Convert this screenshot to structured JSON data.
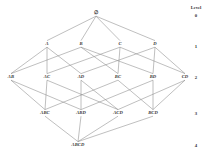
{
  "diagram": {
    "type": "hasse-lattice",
    "stroke_color": "#8a8a8a",
    "text_color": "#333333",
    "background_color": "#ffffff",
    "level_column": {
      "header": "Level",
      "header_x": 196,
      "header_y": 8,
      "numbers": [
        {
          "label": "0",
          "x": 196,
          "y": 16
        },
        {
          "label": "1",
          "x": 196,
          "y": 47
        },
        {
          "label": "2",
          "x": 196,
          "y": 78
        },
        {
          "label": "3",
          "x": 196,
          "y": 114
        },
        {
          "label": "4",
          "x": 196,
          "y": 146
        }
      ]
    },
    "nodes": [
      {
        "id": "empty",
        "label": "∅",
        "x": 96,
        "y": 13,
        "level": 0,
        "top": true
      },
      {
        "id": "A",
        "label": "A",
        "x": 47,
        "y": 44,
        "level": 1,
        "top": false
      },
      {
        "id": "B",
        "label": "B",
        "x": 81,
        "y": 44,
        "level": 1,
        "top": false
      },
      {
        "id": "C",
        "label": "C",
        "x": 120,
        "y": 44,
        "level": 1,
        "top": false
      },
      {
        "id": "D",
        "label": "D",
        "x": 155,
        "y": 44,
        "level": 1,
        "top": false
      },
      {
        "id": "AB",
        "label": "AB",
        "x": 11,
        "y": 77,
        "level": 2,
        "top": false
      },
      {
        "id": "AC",
        "label": "AC",
        "x": 47,
        "y": 77,
        "level": 2,
        "top": false
      },
      {
        "id": "AD",
        "label": "AD",
        "x": 81,
        "y": 77,
        "level": 2,
        "top": false
      },
      {
        "id": "BC",
        "label": "BC",
        "x": 118,
        "y": 77,
        "level": 2,
        "top": false
      },
      {
        "id": "BD",
        "label": "BD",
        "x": 153,
        "y": 77,
        "level": 2,
        "top": false
      },
      {
        "id": "CD",
        "label": "CD",
        "x": 185,
        "y": 77,
        "level": 2,
        "top": false
      },
      {
        "id": "ABC",
        "label": "ABC",
        "x": 45,
        "y": 113,
        "level": 3,
        "top": false
      },
      {
        "id": "ABD",
        "label": "ABD",
        "x": 81,
        "y": 113,
        "level": 3,
        "top": false
      },
      {
        "id": "ACD",
        "label": "ACD",
        "x": 118,
        "y": 113,
        "level": 3,
        "top": false
      },
      {
        "id": "BCD",
        "label": "BCD",
        "x": 153,
        "y": 113,
        "level": 3,
        "top": false
      },
      {
        "id": "ABCD",
        "label": "ABCD",
        "x": 78,
        "y": 145,
        "level": 4,
        "top": false
      }
    ],
    "edges": [
      {
        "from": "empty",
        "to": "A"
      },
      {
        "from": "empty",
        "to": "B"
      },
      {
        "from": "empty",
        "to": "C"
      },
      {
        "from": "empty",
        "to": "D"
      },
      {
        "from": "A",
        "to": "AB"
      },
      {
        "from": "A",
        "to": "AC"
      },
      {
        "from": "A",
        "to": "AD"
      },
      {
        "from": "B",
        "to": "AB"
      },
      {
        "from": "B",
        "to": "BC"
      },
      {
        "from": "B",
        "to": "BD"
      },
      {
        "from": "C",
        "to": "AC"
      },
      {
        "from": "C",
        "to": "BC"
      },
      {
        "from": "C",
        "to": "CD"
      },
      {
        "from": "D",
        "to": "AD"
      },
      {
        "from": "D",
        "to": "BD"
      },
      {
        "from": "D",
        "to": "CD"
      },
      {
        "from": "AB",
        "to": "ABC"
      },
      {
        "from": "AB",
        "to": "ABD"
      },
      {
        "from": "AC",
        "to": "ABC"
      },
      {
        "from": "AC",
        "to": "ACD"
      },
      {
        "from": "AD",
        "to": "ABD"
      },
      {
        "from": "AD",
        "to": "ACD"
      },
      {
        "from": "BC",
        "to": "ABC"
      },
      {
        "from": "BC",
        "to": "BCD"
      },
      {
        "from": "BD",
        "to": "ABD"
      },
      {
        "from": "BD",
        "to": "BCD"
      },
      {
        "from": "CD",
        "to": "ACD"
      },
      {
        "from": "CD",
        "to": "BCD"
      },
      {
        "from": "ABC",
        "to": "ABCD"
      },
      {
        "from": "ABD",
        "to": "ABCD"
      },
      {
        "from": "ACD",
        "to": "ABCD"
      },
      {
        "from": "BCD",
        "to": "ABCD"
      }
    ]
  }
}
